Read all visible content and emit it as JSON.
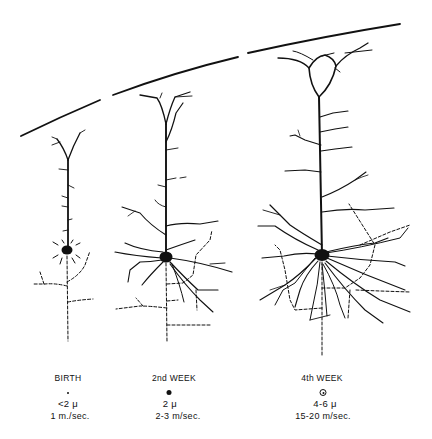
{
  "figure": {
    "type": "neuron-development-diagram",
    "stages": [
      {
        "label": "BIRTH",
        "axon_diameter": "<2 μ",
        "conduction_velocity": "1 m./sec.",
        "marker": "small-dot",
        "x": 68
      },
      {
        "label": "2nd WEEK",
        "axon_diameter": "2 μ",
        "conduction_velocity": "2-3 m/sec.",
        "marker": "medium-dot",
        "x": 168
      },
      {
        "label": "4th WEEK",
        "axon_diameter": "4-6 μ",
        "conduction_velocity": "15-20 m/sec.",
        "marker": "ring-dot",
        "x": 323
      }
    ],
    "colors": {
      "ink": "#111111",
      "background": "#ffffff"
    }
  }
}
